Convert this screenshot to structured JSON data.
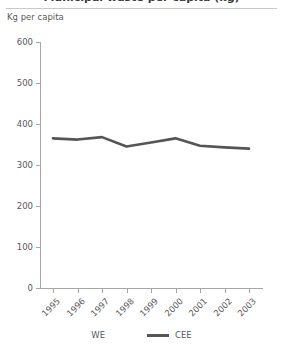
{
  "title": {
    "text": "Municipal waste per capita (kg)",
    "truncated": true
  },
  "axis_unit_label": "Kg per capita",
  "legend": {
    "items": [
      {
        "name": "we",
        "label": "WE",
        "color": "#ffffff"
      },
      {
        "name": "cee",
        "label": "CEE",
        "color": "#555555"
      }
    ]
  },
  "chart_data": {
    "type": "line",
    "title": "Municipal waste per capita (kg)",
    "xlabel": "",
    "ylabel": "Kg per capita",
    "categories": [
      "1995",
      "1996",
      "1997",
      "1998",
      "1999",
      "2000",
      "2001",
      "2002",
      "2003"
    ],
    "ylim": [
      0,
      600
    ],
    "yticks": [
      0,
      100,
      200,
      300,
      400,
      500,
      600
    ],
    "ytick_labels": [
      "0",
      "100",
      "200",
      "300",
      "400",
      "500",
      "600"
    ],
    "grid": false,
    "legend_position": "bottom",
    "xtick_rotation": -45,
    "series": [
      {
        "name": "WE",
        "color": "#ffffff",
        "visible": false,
        "values": [
          null,
          null,
          null,
          null,
          null,
          null,
          null,
          null,
          null
        ]
      },
      {
        "name": "CEE",
        "color": "#555555",
        "visible": true,
        "values": [
          365,
          362,
          368,
          345,
          355,
          365,
          347,
          343,
          340
        ]
      }
    ]
  }
}
